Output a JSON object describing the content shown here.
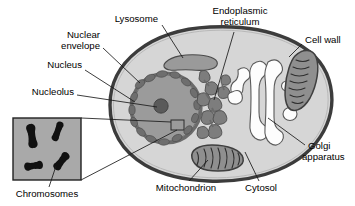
{
  "figure": {
    "type": "biological-diagram"
  },
  "labels": {
    "lysosome": "Lysosome",
    "nuclear_envelope_line1": "Nuclear",
    "nuclear_envelope_line2": "envelope",
    "nucleus": "Nucleus",
    "nucleolus": "Nucleolus",
    "chromosomes": "Chromosomes",
    "endoplasmic_reticulum_line1": "Endoplasmic",
    "endoplasmic_reticulum_line2": "reticulum",
    "cell_wall": "Cell wall",
    "golgi_line1": "Golgi",
    "golgi_line2": "apparatus",
    "cytosol": "Cytosol",
    "mitochondrion": "Mitochondrion"
  },
  "colors": {
    "background": "#ffffff",
    "cell_wall_outline": "#3c3c3c",
    "cytosol_fill": "#d6d6d6",
    "nucleus_fill": "#9b9b9b",
    "nucleolus_fill": "#5e5e5e",
    "nuclear_envelope": "#6b6b6b",
    "organelle_gray": "#8f8f8f",
    "er_gray": "#7d7d7d",
    "golgi_fill": "#fdfdfd",
    "inset_background": "#a9a9a9",
    "chromosome_fill": "#111111",
    "leader_line": "#1a1a1a",
    "text": "#000000"
  },
  "organelles": [
    {
      "name": "cell-wall",
      "label": "Cell wall"
    },
    {
      "name": "cytosol",
      "label": "Cytosol"
    },
    {
      "name": "nucleus",
      "label": "Nucleus"
    },
    {
      "name": "nucleolus",
      "label": "Nucleolus"
    },
    {
      "name": "nuclear-envelope",
      "label": "Nuclear envelope"
    },
    {
      "name": "lysosome",
      "label": "Lysosome"
    },
    {
      "name": "endoplasmic-reticulum",
      "label": "Endoplasmic reticulum"
    },
    {
      "name": "golgi-apparatus",
      "label": "Golgi apparatus"
    },
    {
      "name": "mitochondrion",
      "label": "Mitochondrion"
    },
    {
      "name": "chromosomes",
      "label": "Chromosomes"
    }
  ],
  "inset": {
    "name": "chromosome-inset",
    "caption": "Chromosomes",
    "chromosome_count": 4
  }
}
